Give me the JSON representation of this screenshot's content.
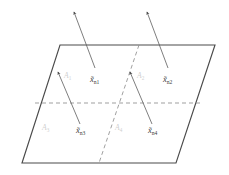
{
  "figure": {
    "title": "",
    "type": "geometric-partition-diagram",
    "colors": {
      "plane_edge": "#4a4a4a",
      "partition_dashed": "#8f8f8f",
      "vector": "#5d5d5d",
      "point_label": "#3b3b3b",
      "region_label": "#cfcfcf",
      "background": "#ffffff"
    },
    "plane": {
      "name": "parallelogram-plane",
      "vertices": [
        {
          "x": 60,
          "y": 45
        },
        {
          "x": 215,
          "y": 45
        },
        {
          "x": 176,
          "y": 163
        },
        {
          "x": 22,
          "y": 163
        }
      ]
    },
    "partitions": [
      {
        "name": "horizontal-divider",
        "style": "dashed",
        "from": {
          "x": 35,
          "y": 103
        },
        "to": {
          "x": 202,
          "y": 103
        }
      },
      {
        "name": "diagonal-divider",
        "style": "dashed",
        "from": {
          "x": 139,
          "y": 45
        },
        "to": {
          "x": 99,
          "y": 163
        }
      }
    ],
    "regions": [
      {
        "id": "A1",
        "label": "A",
        "subscript": "1",
        "x": 64,
        "y": 78
      },
      {
        "id": "A2",
        "label": "A",
        "subscript": "2",
        "x": 137,
        "y": 78
      },
      {
        "id": "A3",
        "label": "A",
        "subscript": "3",
        "x": 42,
        "y": 130
      },
      {
        "id": "A4",
        "label": "A",
        "subscript": "4",
        "x": 115,
        "y": 130
      }
    ],
    "points": [
      {
        "id": "xn1",
        "label": "x̃",
        "subscript": "n1",
        "label_x": 90,
        "label_y": 82,
        "vector": {
          "from": {
            "x": 95,
            "y": 68
          },
          "to": {
            "x": 74,
            "y": 12
          }
        },
        "extends_beyond_plane": true
      },
      {
        "id": "xn2",
        "label": "x̃",
        "subscript": "n2",
        "label_x": 163,
        "label_y": 82,
        "vector": {
          "from": {
            "x": 168,
            "y": 68
          },
          "to": {
            "x": 147,
            "y": 12
          }
        },
        "extends_beyond_plane": true
      },
      {
        "id": "xn3",
        "label": "x̃",
        "subscript": "n3",
        "label_x": 76,
        "label_y": 133,
        "vector": {
          "from": {
            "x": 80,
            "y": 124
          },
          "to": {
            "x": 58,
            "y": 72
          }
        },
        "extends_beyond_plane": false
      },
      {
        "id": "xn4",
        "label": "x̃",
        "subscript": "n4",
        "label_x": 148,
        "label_y": 133,
        "vector": {
          "from": {
            "x": 152,
            "y": 124
          },
          "to": {
            "x": 130,
            "y": 72
          }
        },
        "extends_beyond_plane": false
      }
    ]
  }
}
